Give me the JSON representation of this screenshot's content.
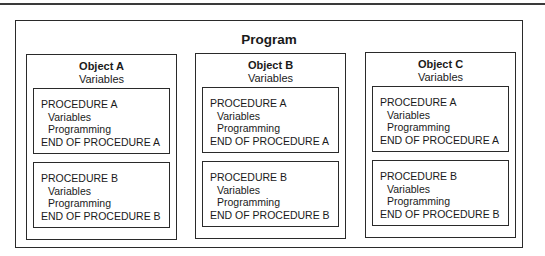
{
  "diagram": {
    "title": "Program",
    "objects": [
      {
        "name": "Object A",
        "variables": "Variables",
        "procedures": [
          {
            "header": "PROCEDURE A",
            "variables": "Variables",
            "programming": "Programming",
            "footer": "END OF PROCEDURE A"
          },
          {
            "header": "PROCEDURE B",
            "variables": "Variables",
            "programming": "Programming",
            "footer": "END OF PROCEDURE B"
          }
        ]
      },
      {
        "name": "Object B",
        "variables": "Variables",
        "procedures": [
          {
            "header": "PROCEDURE A",
            "variables": "Variables",
            "programming": "Programming",
            "footer": "END OF PROCEDURE A"
          },
          {
            "header": "PROCEDURE B",
            "variables": "Variables",
            "programming": "Programming",
            "footer": "END OF PROCEDURE B"
          }
        ]
      },
      {
        "name": "Object C",
        "variables": "Variables",
        "procedures": [
          {
            "header": "PROCEDURE A",
            "variables": "Variables",
            "programming": "Programming",
            "footer": "END OF PROCEDURE A"
          },
          {
            "header": "PROCEDURE B",
            "variables": "Variables",
            "programming": "Programming",
            "footer": "END OF PROCEDURE B"
          }
        ]
      }
    ]
  }
}
